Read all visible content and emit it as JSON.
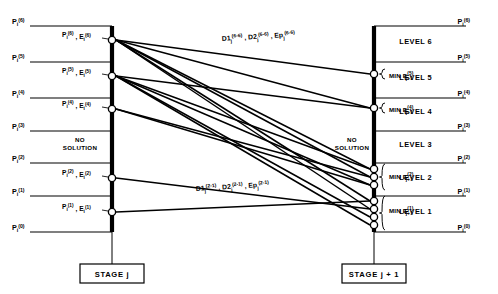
{
  "axes": {
    "left": {
      "label": "STAGE j",
      "x": 112
    },
    "right": {
      "label": "STAGE j + 1",
      "x": 374
    }
  },
  "pressure_labels": {
    "base": "P",
    "subscript": "i",
    "values": [
      "(6)",
      "(5)",
      "(4)",
      "(3)",
      "(2)",
      "(1)",
      "(0)"
    ]
  },
  "left_boundaries": [
    {
      "label": "(6)",
      "y": 26
    },
    {
      "label": "(5)",
      "y": 62
    },
    {
      "label": "(4)",
      "y": 98
    },
    {
      "label": "(3)",
      "y": 131
    },
    {
      "label": "(2)",
      "y": 163
    },
    {
      "label": "(1)",
      "y": 196
    },
    {
      "label": "(0)",
      "y": 232
    }
  ],
  "right_boundaries": [
    {
      "label": "(6)",
      "y": 26
    },
    {
      "label": "(5)",
      "y": 62
    },
    {
      "label": "(4)",
      "y": 98
    },
    {
      "label": "(3)",
      "y": 131
    },
    {
      "label": "(2)",
      "y": 163
    },
    {
      "label": "(1)",
      "y": 196
    },
    {
      "label": "(0)",
      "y": 232
    }
  ],
  "levels": [
    {
      "name": "LEVEL 6",
      "y": 44
    },
    {
      "name": "LEVEL 5",
      "y": 80
    },
    {
      "name": "LEVEL 4",
      "y": 114
    },
    {
      "name": "LEVEL 3",
      "y": 147
    },
    {
      "name": "LEVEL 2",
      "y": 180
    },
    {
      "name": "LEVEL 1",
      "y": 214
    }
  ],
  "left_nodes": [
    {
      "y": 40,
      "base1": "P",
      "sub1": "i",
      "sup1": "(6)",
      "base2": "E",
      "sub2": "i",
      "sup2": "(6)"
    },
    {
      "y": 76,
      "base1": "P",
      "sub1": "i",
      "sup1": "(5)",
      "base2": "E",
      "sub2": "i",
      "sup2": "(5)"
    },
    {
      "y": 109,
      "base1": "P",
      "sub1": "i",
      "sup1": "(4)",
      "base2": "E",
      "sub2": "i",
      "sup2": "(4)"
    },
    {
      "y": 178,
      "base1": "P",
      "sub1": "i",
      "sup1": "(2)",
      "base2": "E",
      "sub2": "i",
      "sup2": "(2)"
    },
    {
      "y": 212,
      "base1": "P",
      "sub1": "i",
      "sup1": "(1)",
      "base2": "E",
      "sub2": "i",
      "sup2": "(1)"
    }
  ],
  "left_no_solution": {
    "text_line1": "NO",
    "text_line2": "SOLUTION",
    "y": 142
  },
  "right_no_solution": {
    "text_line1": "NO",
    "text_line2": "SOLUTION",
    "y": 142
  },
  "right_node_groups": [
    {
      "level": "LEVEL 5",
      "min_base": "MIN E",
      "min_sub": "j+1",
      "min_sup": "(5)",
      "label_y": 78,
      "nodes": [
        {
          "y": 74
        }
      ]
    },
    {
      "level": "LEVEL 4",
      "min_base": "MIN E",
      "min_sub": "j+1",
      "min_sup": "(4)",
      "label_y": 112,
      "nodes": [
        {
          "y": 108
        }
      ]
    },
    {
      "level": "LEVEL 2",
      "min_base": "MIN E",
      "min_sub": "j+1",
      "min_sup": "(2)",
      "label_y": 179,
      "nodes": [
        {
          "y": 169
        },
        {
          "y": 177
        },
        {
          "y": 185
        }
      ]
    },
    {
      "level": "LEVEL 1",
      "min_base": "MIN E",
      "min_sub": "j+1",
      "min_sup": "(1)",
      "label_y": 213,
      "nodes": [
        {
          "y": 201
        },
        {
          "y": 209
        },
        {
          "y": 217
        },
        {
          "y": 225
        }
      ]
    }
  ],
  "edge_labels": [
    {
      "id": "top-transition",
      "x": 222,
      "y": 41,
      "rotate": -4.5,
      "terms": [
        {
          "base": "D1",
          "sub": "j",
          "sup": "(6-6)"
        },
        {
          "base": "D2",
          "sub": "j",
          "sup": "(6-6)"
        },
        {
          "base": "Ep",
          "sub": "j",
          "sup": "(6-6)"
        }
      ]
    },
    {
      "id": "bottom-transition",
      "x": 196,
      "y": 191,
      "rotate": -4.5,
      "terms": [
        {
          "base": "D1",
          "sub": "j",
          "sup": "(2-1)"
        },
        {
          "base": "D2",
          "sub": "j",
          "sup": "(2-1)"
        },
        {
          "base": "Ep",
          "sub": "j",
          "sup": "(2-1)"
        }
      ]
    }
  ],
  "edges": [
    {
      "from_y": 40,
      "to_y": 74
    },
    {
      "from_y": 40,
      "to_y": 108
    },
    {
      "from_y": 40,
      "to_y": 169
    },
    {
      "from_y": 40,
      "to_y": 177
    },
    {
      "from_y": 40,
      "to_y": 201
    },
    {
      "from_y": 40,
      "to_y": 209
    },
    {
      "from_y": 76,
      "to_y": 108
    },
    {
      "from_y": 76,
      "to_y": 169
    },
    {
      "from_y": 76,
      "to_y": 185
    },
    {
      "from_y": 76,
      "to_y": 217
    },
    {
      "from_y": 76,
      "to_y": 225
    },
    {
      "from_y": 109,
      "to_y": 177
    },
    {
      "from_y": 109,
      "to_y": 185
    },
    {
      "from_y": 178,
      "to_y": 209
    },
    {
      "from_y": 212,
      "to_y": 201
    }
  ],
  "colors": {
    "ink": "#000000",
    "background": "#ffffff"
  }
}
